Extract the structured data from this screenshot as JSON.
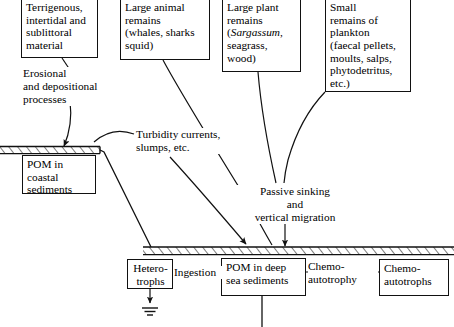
{
  "diagram": {
    "stroke_color": "#111111",
    "background_color": "#ffffff",
    "source_boxes": [
      {
        "id": "terrigenous",
        "text": "Terrigenous,\nintertidal and\nsublittoral\nmaterial"
      },
      {
        "id": "large-animal",
        "text": "Large animal\nremains\n(whales, sharks\nsquid)"
      },
      {
        "id": "large-plant-pre",
        "text": "Large plant\nremains\n("
      },
      {
        "id": "large-plant-italic",
        "text": "Sargassum"
      },
      {
        "id": "large-plant-post",
        "text": ",\nseagrass,\nwood)"
      },
      {
        "id": "small-plankton",
        "text": "Small\nremains of\nplankton\n(faecal pellets,\nmoults, salps,\nphytodetritus,\netc.)"
      }
    ],
    "sink_boxes": [
      {
        "id": "pom-coastal",
        "text": "POM in\ncoastal\nsediments"
      },
      {
        "id": "heterotrophs",
        "text": "Hetero-\ntrophs"
      },
      {
        "id": "pom-deep",
        "text": "POM in deep\nsea sediments"
      },
      {
        "id": "chemoautotrophs",
        "text": "Chemo-\nautotrophs"
      }
    ],
    "process_labels": [
      {
        "id": "erosional",
        "text": "Erosional\nand depositional\nprocesses"
      },
      {
        "id": "turbidity",
        "text": "Turbidity currents,\nslumps, etc."
      },
      {
        "id": "passive-sinking",
        "text": "Passive sinking\nand\nvertical migration"
      },
      {
        "id": "ingestion",
        "text": "Ingestion"
      },
      {
        "id": "chemoautotrophy",
        "text": "Chemo-\nautotrophy"
      }
    ],
    "seafloor_bands": [
      {
        "id": "coastal-shelf",
        "description": "hatched coastal shelf band"
      },
      {
        "id": "deep-seafloor",
        "description": "hatched deep seafloor band"
      }
    ]
  }
}
